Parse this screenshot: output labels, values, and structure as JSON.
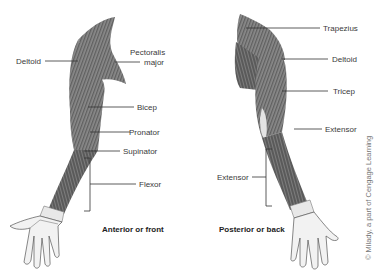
{
  "diagram": {
    "panels": [
      {
        "id": "anterior",
        "caption": "Anterior or front",
        "labels": [
          {
            "text": "Deltoid"
          },
          {
            "text": "Pectoralis"
          },
          {
            "text": "major"
          },
          {
            "text": "Bicep"
          },
          {
            "text": "Pronator"
          },
          {
            "text": "Supinator"
          },
          {
            "text": "Flexor"
          }
        ]
      },
      {
        "id": "posterior",
        "caption": "Posterior or back",
        "labels": [
          {
            "text": "Trapezius"
          },
          {
            "text": "Deltoid"
          },
          {
            "text": "Tricep"
          },
          {
            "text": "Extensor"
          },
          {
            "text": "Extensor"
          }
        ]
      }
    ],
    "credit": "© Milady, a part of Cengage Learning"
  },
  "colors": {
    "muscle_dark": "#4a4a4a",
    "muscle_mid": "#7a7a7a",
    "muscle_light": "#bdbdbd",
    "leader_line": "#333333",
    "background": "#ffffff"
  }
}
